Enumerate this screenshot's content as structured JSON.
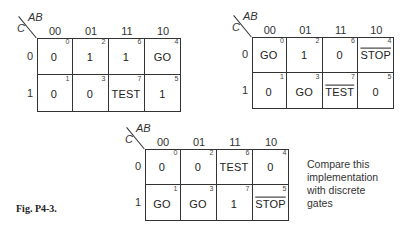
{
  "figure_caption": "Fig. P4-3.",
  "note": [
    "Compare this",
    "implementation",
    "with discrete",
    "gates"
  ],
  "axis": {
    "col_var": "AB",
    "row_var": "C",
    "col_labels": [
      "00",
      "01",
      "11",
      "10"
    ],
    "row_labels": [
      "0",
      "1"
    ]
  },
  "maps": [
    {
      "name": "map-1",
      "rows": [
        [
          {
            "v": "0",
            "i": "0",
            "bar": false
          },
          {
            "v": "1",
            "i": "2",
            "bar": false
          },
          {
            "v": "1",
            "i": "6",
            "bar": false
          },
          {
            "v": "GO",
            "i": "4",
            "bar": false
          }
        ],
        [
          {
            "v": "0",
            "i": "1",
            "bar": false
          },
          {
            "v": "0",
            "i": "3",
            "bar": false
          },
          {
            "v": "TEST",
            "i": "7",
            "bar": false
          },
          {
            "v": "1",
            "i": "5",
            "bar": false
          }
        ]
      ]
    },
    {
      "name": "map-2",
      "rows": [
        [
          {
            "v": "GO",
            "i": "0",
            "bar": false
          },
          {
            "v": "1",
            "i": "2",
            "bar": false
          },
          {
            "v": "0",
            "i": "6",
            "bar": false
          },
          {
            "v": "STOP",
            "i": "4",
            "bar": true
          }
        ],
        [
          {
            "v": "0",
            "i": "1",
            "bar": false
          },
          {
            "v": "GO",
            "i": "3",
            "bar": false
          },
          {
            "v": "TEST",
            "i": "7",
            "bar": true
          },
          {
            "v": "0",
            "i": "5",
            "bar": false
          }
        ]
      ]
    },
    {
      "name": "map-3",
      "rows": [
        [
          {
            "v": "0",
            "i": "0",
            "bar": false
          },
          {
            "v": "0",
            "i": "2",
            "bar": false
          },
          {
            "v": "TEST",
            "i": "6",
            "bar": false
          },
          {
            "v": "0",
            "i": "4",
            "bar": false
          }
        ],
        [
          {
            "v": "GO",
            "i": "1",
            "bar": false
          },
          {
            "v": "GO",
            "i": "3",
            "bar": false
          },
          {
            "v": "1",
            "i": "7",
            "bar": false
          },
          {
            "v": "STOP",
            "i": "5",
            "bar": true
          }
        ]
      ]
    }
  ]
}
